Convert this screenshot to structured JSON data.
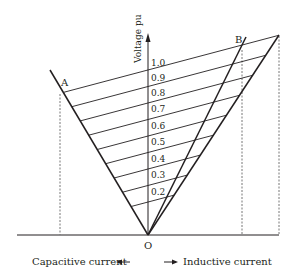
{
  "diagram": {
    "type": "voltage-current characteristic (static var compensator)",
    "y_axis_label": "Voltage pu",
    "x_axis_left_label": "Capacitive current",
    "x_axis_right_label": "Inductive current",
    "origin_label": "O",
    "point_labels": {
      "a": "A",
      "b": "B"
    },
    "voltage_levels": [
      "1.0",
      "0.9",
      "0.8",
      "0.7",
      "0.6",
      "0.5",
      "0.4",
      "0.3",
      "0.2"
    ],
    "colors": {
      "line": "#231f20",
      "dashed": "#777777",
      "background": "#ffffff"
    }
  }
}
